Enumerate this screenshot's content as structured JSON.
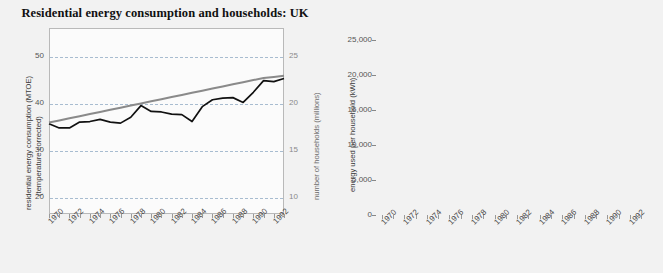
{
  "figure": {
    "title": "Residential energy consumption and households: UK",
    "background_color": "#f2f2f2",
    "plot_background_color": "#fbfbfb"
  },
  "legend": {
    "position": "bottom-right",
    "items": [
      {
        "label": "electricity",
        "color": "#7a7a7a"
      },
      {
        "label": "natural gas",
        "color": "#c3c3c3"
      },
      {
        "label": "other",
        "color": "#9a9a9a"
      }
    ]
  },
  "chart_data": [
    {
      "type": "line",
      "title": "Residential energy consumption and households: UK",
      "xlabel": "",
      "ylabel": "residential energy consumption (MTOE) (temperature corrected)",
      "ylabel_right": "number of households (millions)",
      "grid": true,
      "xlim": [
        1970,
        1993
      ],
      "ylim": [
        20,
        55
      ],
      "ylim_right": [
        10,
        27.5
      ],
      "yticks": [
        20,
        30,
        40,
        50
      ],
      "yticks_right": [
        10,
        15,
        20,
        25
      ],
      "x": [
        1970,
        1971,
        1972,
        1973,
        1974,
        1975,
        1976,
        1977,
        1978,
        1979,
        1980,
        1981,
        1982,
        1983,
        1984,
        1985,
        1986,
        1987,
        1988,
        1989,
        1990,
        1991,
        1992,
        1993
      ],
      "xtick_labels": [
        "1970",
        "1972",
        "1974",
        "1976",
        "1978",
        "1980",
        "1982",
        "1984",
        "1986",
        "1988",
        "1990",
        "1992"
      ],
      "series": [
        {
          "name": "residential energy consumption (MTOE)",
          "axis": "left",
          "color": "#111111",
          "values": [
            37.0,
            36.2,
            36.2,
            37.3,
            37.4,
            37.8,
            37.3,
            37.1,
            38.2,
            40.4,
            39.3,
            39.2,
            38.8,
            38.7,
            37.4,
            40.2,
            41.5,
            41.8,
            41.9,
            41.0,
            42.9,
            45.1,
            44.9,
            45.5
          ]
        },
        {
          "name": "number of households (millions)",
          "axis": "right",
          "color": "#8a8a8a",
          "values": [
            18.6,
            18.8,
            19.0,
            19.2,
            19.4,
            19.6,
            19.8,
            20.0,
            20.2,
            20.4,
            20.6,
            20.8,
            21.0,
            21.2,
            21.4,
            21.6,
            21.8,
            22.0,
            22.2,
            22.4,
            22.6,
            22.8,
            22.9,
            23.0
          ]
        }
      ]
    },
    {
      "type": "bar",
      "stacked": true,
      "title": "",
      "xlabel": "",
      "ylabel": "energy used per household (kWh)",
      "grid": true,
      "ylim": [
        0,
        25000
      ],
      "yticks": [
        0,
        5000,
        10000,
        15000,
        20000,
        25000
      ],
      "ytick_labels": [
        "0",
        "5,000",
        "10,000",
        "15,000",
        "20,000",
        "25,000"
      ],
      "categories": [
        1970,
        1971,
        1972,
        1973,
        1974,
        1975,
        1976,
        1977,
        1978,
        1979,
        1980,
        1981,
        1982,
        1983,
        1984,
        1985,
        1986,
        1987,
        1988,
        1989,
        1990,
        1991,
        1992,
        1993
      ],
      "xtick_labels": [
        "1970",
        "1972",
        "1974",
        "1976",
        "1978",
        "1980",
        "1982",
        "1984",
        "1986",
        "1988",
        "1990",
        "1992"
      ],
      "series": [
        {
          "name": "electricity",
          "color": "#7a7a7a",
          "values": [
            4100,
            4100,
            4200,
            4500,
            4600,
            4600,
            4600,
            4600,
            4700,
            4600,
            4400,
            4300,
            4300,
            4300,
            4300,
            4400,
            4400,
            4500,
            4500,
            4500,
            4500,
            4600,
            4600,
            4600
          ]
        },
        {
          "name": "natural gas",
          "color": "#c3c3c3",
          "values": [
            5200,
            6300,
            7300,
            8300,
            9100,
            9600,
            10300,
            10700,
            11100,
            11900,
            12300,
            12400,
            12300,
            12100,
            12100,
            12800,
            13500,
            13500,
            13300,
            12800,
            13000,
            13600,
            14000,
            14300
          ]
        },
        {
          "name": "other",
          "color": "#9a9a9a",
          "values": [
            13800,
            11600,
            10300,
            10100,
            9300,
            8000,
            6900,
            7200,
            7000,
            8000,
            6400,
            6400,
            5700,
            5600,
            4800,
            6000,
            6000,
            5800,
            4900,
            4000,
            3700,
            4700,
            3700,
            4000
          ]
        }
      ]
    }
  ]
}
